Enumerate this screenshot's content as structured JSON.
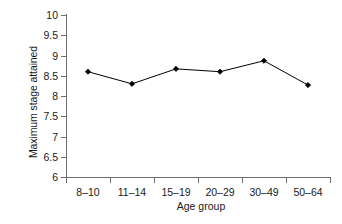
{
  "chart_data": {
    "type": "line",
    "title": "",
    "xlabel": "Age group",
    "ylabel": "Maximum stage attained",
    "categories": [
      "8–10",
      "11–14",
      "15–19",
      "20–29",
      "30–49",
      "50–64"
    ],
    "values": [
      8.6,
      8.3,
      8.67,
      8.6,
      8.87,
      8.27
    ],
    "series": [
      {
        "name": "Maximum stage attained",
        "values": [
          8.6,
          8.3,
          8.67,
          8.6,
          8.87,
          8.27
        ]
      }
    ],
    "ylim": [
      6,
      10
    ],
    "yticks": [
      6,
      6.5,
      7,
      7.5,
      8,
      8.5,
      9,
      9.5,
      10
    ],
    "ytick_labels": [
      "6",
      "6.5",
      "7",
      "7.5",
      "8",
      "8.5",
      "9",
      "9.5",
      "10"
    ],
    "grid": false,
    "legend": false,
    "legend_position": "none",
    "marker": "diamond",
    "line_color": "#000000",
    "marker_color": "#000000",
    "background_color": "#ffffff",
    "axis_color": "#6e6e6e"
  }
}
